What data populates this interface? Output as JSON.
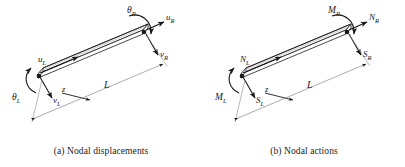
{
  "figure": {
    "background_color": "#ffffff",
    "line_color": "#1a1a1a",
    "panels": [
      {
        "id": "a",
        "caption": "(a) Nodal displacements",
        "length_label": "L",
        "axis_label": "z",
        "left_node": {
          "axial_label": "u_L",
          "axial_label_text": "u",
          "axial_sub": "L",
          "transverse_label_text": "v",
          "transverse_sub": "L",
          "rotation_label_text": "θ",
          "rotation_sub": "L"
        },
        "right_node": {
          "axial_label_text": "u",
          "axial_sub": "R",
          "transverse_label_text": "v",
          "transverse_sub": "R",
          "rotation_label_text": "θ",
          "rotation_sub": "R"
        }
      },
      {
        "id": "b",
        "caption": "(b) Nodal actions",
        "length_label": "L",
        "axis_label": "z",
        "left_node": {
          "axial_label_text": "N",
          "axial_sub": "L",
          "transverse_label_text": "S",
          "transverse_sub": "L",
          "rotation_label_text": "M",
          "rotation_sub": "L"
        },
        "right_node": {
          "axial_label_text": "N",
          "axial_sub": "R",
          "transverse_label_text": "S",
          "transverse_sub": "R",
          "rotation_label_text": "M",
          "rotation_sub": "R"
        }
      }
    ]
  }
}
